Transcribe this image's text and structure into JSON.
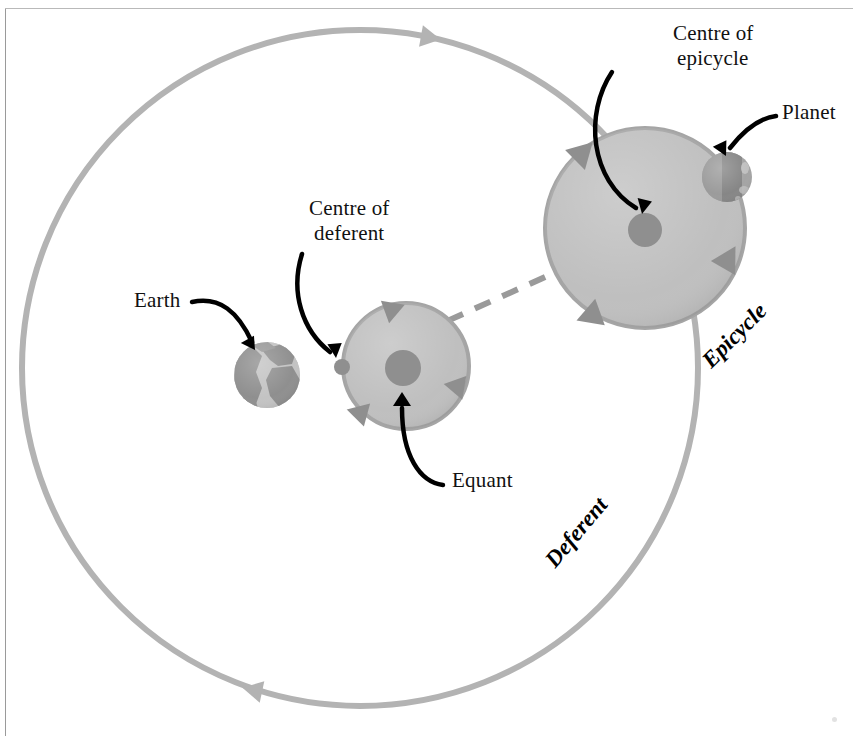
{
  "diagram": {
    "background_color": "#ffffff",
    "orbit_color": "#b0b0b0",
    "disc_fill_color": "#bdbdbd",
    "disc_stroke_color": "#a0a0a0",
    "marker_color": "#8f8f8f",
    "arrow_color": "#000000",
    "dashed_line_color": "#9a9a9a",
    "earth_land_color": "#c3c3c3",
    "earth_ocean_color": "#8e8e8e",
    "planet_color": "#909090"
  },
  "labels": {
    "earth": "Earth",
    "centre_of_deferent": "Centre of\ndeferent",
    "centre_of_deferent_line1": "Centre of",
    "centre_of_deferent_line2": "deferent",
    "centre_of_epicycle_line1": "Centre of",
    "centre_of_epicycle_line2": "epicycle",
    "planet": "Planet",
    "equant": "Equant",
    "deferent": "Deferent",
    "epicycle": "Epicycle"
  },
  "geometry": {
    "deferent_circle": {
      "cx": 360,
      "cy": 368,
      "r": 338
    },
    "epicycle_circle": {
      "cx": 645,
      "cy": 228,
      "r": 100
    },
    "deferent_centre_circle": {
      "cx": 406,
      "cy": 366,
      "r": 63
    },
    "earth": {
      "cx": 267,
      "cy": 375,
      "r": 33
    },
    "planet": {
      "cx": 727,
      "cy": 177,
      "r": 25
    },
    "equant_point": {
      "cx": 403,
      "cy": 368,
      "r": 17
    },
    "centre_of_deferent_point": {
      "cx": 342,
      "cy": 367,
      "r": 8
    },
    "centre_of_epicycle_point": {
      "cx": 645,
      "cy": 230,
      "r": 17
    },
    "dashed_line": {
      "x1": 338,
      "y1": 370,
      "x2": 648,
      "y2": 230
    }
  }
}
